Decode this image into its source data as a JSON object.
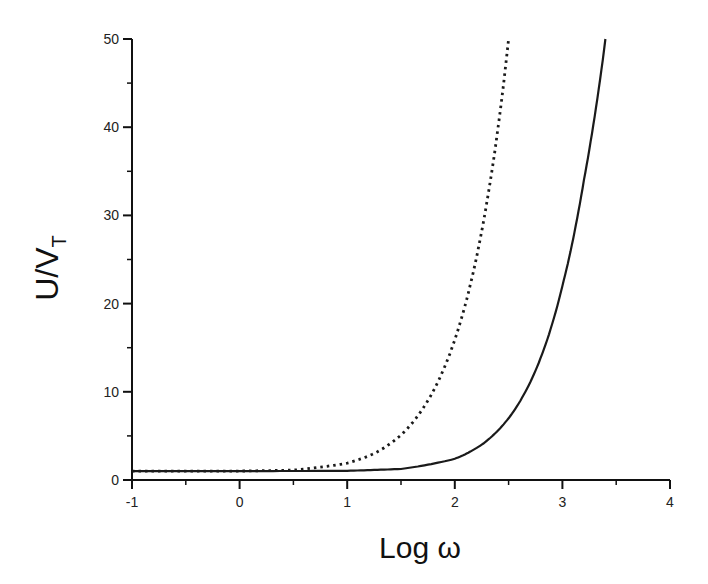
{
  "chart_data": {
    "type": "line",
    "title": "",
    "xlabel": "Log ω",
    "ylabel_main": "U/V",
    "ylabel_sub": "T",
    "xlim": [
      -1,
      4
    ],
    "ylim": [
      0,
      50
    ],
    "grid": false,
    "legend": null,
    "x_ticks": [
      -1,
      0,
      1,
      2,
      3,
      4
    ],
    "x_tick_labels": [
      "-1",
      "0",
      "1",
      "2",
      "3",
      "4"
    ],
    "y_ticks": [
      0,
      10,
      20,
      30,
      40,
      50
    ],
    "y_tick_labels": [
      "0",
      "10",
      "20",
      "30",
      "40",
      "50"
    ],
    "series": [
      {
        "name": "dotted curve",
        "style": "dotted",
        "color": "#1a1a1a",
        "x": [
          -1.0,
          0.0,
          0.5,
          1.0,
          1.25,
          1.5,
          1.75,
          2.0,
          2.25,
          2.5
        ],
        "values": [
          1.0,
          1.01,
          1.12,
          1.9,
          3.0,
          5.1,
          9.0,
          15.9,
          28.2,
          50.0
        ]
      },
      {
        "name": "solid curve",
        "style": "solid",
        "color": "#1a1a1a",
        "x": [
          -1.0,
          0.0,
          1.0,
          1.5,
          2.0,
          2.25,
          2.5,
          2.75,
          3.0,
          3.2,
          3.4
        ],
        "values": [
          1.0,
          1.0,
          1.04,
          1.25,
          2.4,
          4.0,
          7.0,
          12.4,
          22.0,
          34.0,
          50.0
        ]
      }
    ]
  }
}
